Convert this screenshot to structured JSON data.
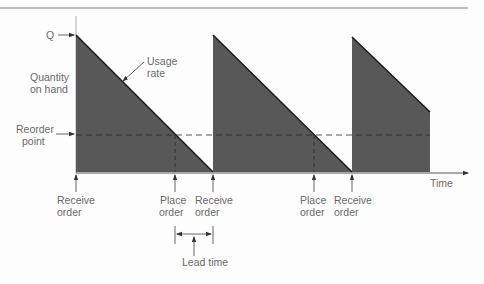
{
  "diagram": {
    "colors": {
      "fill": "#585858",
      "stroke": "#1e1e1e",
      "axis": "#8a8a8a",
      "text": "#6a6a6a",
      "rule": "#7a7a7a"
    },
    "labels": {
      "q": "Q",
      "quantity_line1": "Quantity",
      "quantity_line2": "on hand",
      "usage_line1": "Usage",
      "usage_line2": "rate",
      "reorder_line1": "Reorder",
      "reorder_line2": "point",
      "time": "Time",
      "receive": "Receive",
      "place": "Place",
      "order": "order",
      "lead_time": "Lead time"
    },
    "events": [
      {
        "type": "receive",
        "label1": "Receive",
        "label2": "order"
      },
      {
        "type": "place",
        "label1": "Place",
        "label2": "order"
      },
      {
        "type": "receive",
        "label1": "Receive",
        "label2": "order"
      },
      {
        "type": "place",
        "label1": "Place",
        "label2": "order"
      },
      {
        "type": "receive",
        "label1": "Receive",
        "label2": "order"
      }
    ]
  }
}
